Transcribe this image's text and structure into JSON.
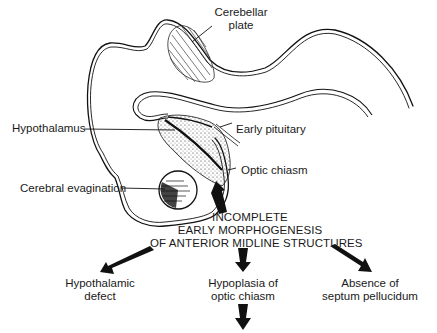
{
  "labels": {
    "cerebellar_plate": [
      "Cerebellar",
      "plate"
    ],
    "hypothalamus": "Hypothalamus",
    "early_pituitary": "Early pituitary",
    "optic_chiasm": "Optic chiasm",
    "cerebral_evagination": "Cerebral evagination"
  },
  "central_cause": {
    "lines": [
      "INCOMPLETE",
      "EARLY MORPHOGENESIS",
      "OF ANTERIOR MIDLINE STRUCTURES"
    ]
  },
  "outcomes": [
    {
      "lines": [
        "Hypothalamic",
        "defect"
      ]
    },
    {
      "lines": [
        "Hypoplasia of",
        "optic chiasm"
      ]
    },
    {
      "lines": [
        "Absence of",
        "septum pellucidum"
      ]
    }
  ],
  "colors": {
    "ink": "#111111",
    "background": "#ffffff"
  }
}
